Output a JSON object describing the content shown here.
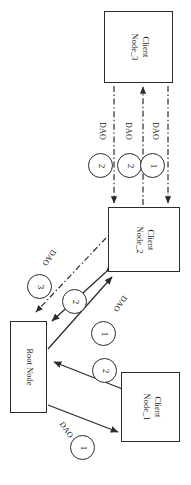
{
  "diagram": {
    "orientation": "rotated-90",
    "stroke_color": "#2b2b2b",
    "background_color": "#ffffff",
    "nodes": [
      {
        "id": "client-node-3",
        "label_line1": "Client",
        "label_line2": "Node_3",
        "x": 104,
        "y": 11,
        "w": 69,
        "h": 72
      },
      {
        "id": "client-node-2",
        "label_line1": "Client",
        "label_line2": "Node_2",
        "x": 108,
        "y": 207,
        "w": 72,
        "h": 65
      },
      {
        "id": "root-node",
        "label_line1": "Root",
        "label_line2": "Node",
        "x": 10,
        "y": 321,
        "w": 37,
        "h": 92
      },
      {
        "id": "client-node-1",
        "label_line1": "Client",
        "label_line2": "Node_1",
        "x": 121,
        "y": 372,
        "w": 59,
        "h": 70
      }
    ],
    "edge_labels": [
      {
        "id": "dao-n2-n3-left",
        "text": "DAO",
        "x": 107,
        "y": 122
      },
      {
        "id": "dao-n2-n3-middle",
        "text": "DAO",
        "x": 133,
        "y": 122
      },
      {
        "id": "dao-n2-n3-right",
        "text": "DAO",
        "x": 160,
        "y": 122
      },
      {
        "id": "dao-root-n2-dash",
        "text": "DAO",
        "x": 58,
        "y": 253
      },
      {
        "id": "dao-root-n2-solid",
        "text": "DAO",
        "x": 129,
        "y": 299
      },
      {
        "id": "dao-root-n1",
        "text": "DAO",
        "x": 65,
        "y": 420
      }
    ],
    "sequence_markers": [
      {
        "id": "seq-n3-left",
        "value": "2",
        "x": 88,
        "y": 153
      },
      {
        "id": "seq-n3-middle",
        "value": "2",
        "x": 117,
        "y": 153
      },
      {
        "id": "seq-n3-right",
        "value": "1",
        "x": 140,
        "y": 153
      },
      {
        "id": "seq-root-dash",
        "value": "3",
        "x": 27,
        "y": 274
      },
      {
        "id": "seq-root-bidi",
        "value": "2",
        "x": 62,
        "y": 289
      },
      {
        "id": "seq-root-n2",
        "value": "1",
        "x": 91,
        "y": 321
      },
      {
        "id": "seq-n1-root",
        "value": "2",
        "x": 92,
        "y": 358
      },
      {
        "id": "seq-root-n1",
        "value": "1",
        "x": 70,
        "y": 435
      }
    ],
    "connections": [
      {
        "id": "conn-n2-to-n3-left",
        "style": "dash-dot",
        "direction": "down",
        "from": "client-node-3",
        "to": "client-node-2"
      },
      {
        "id": "conn-n2-to-n3-middle",
        "style": "dash-dot",
        "direction": "up",
        "from": "client-node-2",
        "to": "client-node-3"
      },
      {
        "id": "conn-n2-to-n3-right",
        "style": "dash-dot",
        "direction": "down",
        "from": "client-node-3",
        "to": "client-node-2"
      },
      {
        "id": "conn-n2-to-root-dash",
        "style": "dash-dot",
        "direction": "to-root",
        "from": "client-node-2",
        "to": "root-node"
      },
      {
        "id": "conn-root-n2-bidi",
        "style": "solid",
        "direction": "bidirectional",
        "from": "client-node-2",
        "to": "root-node"
      },
      {
        "id": "conn-root-to-n2",
        "style": "solid",
        "direction": "up-right",
        "from": "root-node",
        "to": "client-node-2"
      },
      {
        "id": "conn-n1-to-root",
        "style": "solid",
        "direction": "up-left",
        "from": "client-node-1",
        "to": "root-node"
      },
      {
        "id": "conn-root-to-n1",
        "style": "solid",
        "direction": "down-right",
        "from": "root-node",
        "to": "client-node-1"
      }
    ]
  }
}
